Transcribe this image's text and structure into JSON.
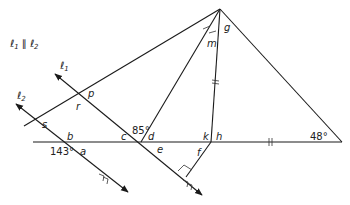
{
  "diagram": {
    "parallel_statement": "ℓ1 ∥ ℓ2",
    "lines": {
      "l1": {
        "label": "ℓ1",
        "sub": "1"
      },
      "l2": {
        "label": "ℓ2",
        "sub": "2"
      }
    },
    "angle_labels": {
      "p": "p",
      "r": "r",
      "s": "s",
      "b": "b",
      "a": "a",
      "c": "c",
      "d": "d",
      "e": "e",
      "f": "f",
      "k": "k",
      "h": "h",
      "g": "g",
      "m": "m"
    },
    "given_angles": {
      "angle_143": "143°",
      "angle_85": "85°",
      "angle_48": "48°"
    },
    "marks": {
      "congruent_single": "m-angle and adjacent angle at g",
      "congruent_double": "segment from h to g and segment from h to right vertex",
      "right_angle": "at foot of f on ℓ1"
    },
    "colors": {
      "line": "#1a1a1a",
      "text": "#222222",
      "background": "#ffffff"
    }
  }
}
